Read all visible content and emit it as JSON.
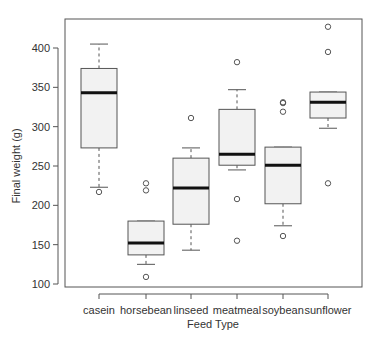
{
  "chart_data": {
    "type": "boxplot",
    "title": "",
    "xlabel": "Feed Type",
    "ylabel": "Final weight (g)",
    "ylim": [
      95,
      430
    ],
    "yticks": [
      100,
      150,
      200,
      250,
      300,
      350,
      400
    ],
    "grid": false,
    "legend": null,
    "categories": [
      "casein",
      "horsebean",
      "linseed",
      "meatmeal",
      "soybean",
      "sunflower"
    ],
    "series": [
      {
        "name": "casein",
        "whisker_low": 223,
        "q1": 273,
        "median": 343,
        "q3": 374,
        "whisker_high": 405,
        "outliers": [
          217
        ]
      },
      {
        "name": "horsebean",
        "whisker_low": 125,
        "q1": 137,
        "median": 152,
        "q3": 180,
        "whisker_high": 180,
        "outliers": [
          228,
          219,
          109
        ]
      },
      {
        "name": "linseed",
        "whisker_low": 143,
        "q1": 176,
        "median": 222,
        "q3": 260,
        "whisker_high": 273,
        "outliers": [
          311
        ]
      },
      {
        "name": "meatmeal",
        "whisker_low": 245,
        "q1": 251,
        "median": 265,
        "q3": 322,
        "whisker_high": 347,
        "outliers": [
          382,
          208,
          155
        ]
      },
      {
        "name": "soybean",
        "whisker_low": 174,
        "q1": 202,
        "median": 251,
        "q3": 274,
        "whisker_high": 274,
        "outliers": [
          331,
          330,
          319,
          161
        ]
      },
      {
        "name": "sunflower",
        "whisker_low": 298,
        "q1": 311,
        "median": 331,
        "q3": 344,
        "whisker_high": 344,
        "outliers": [
          427,
          395,
          228
        ]
      }
    ]
  },
  "style": {
    "box_fill": "#f2f2f2",
    "box_stroke": "#555555",
    "median_stroke": "#111111",
    "axis_color": "#555555"
  }
}
